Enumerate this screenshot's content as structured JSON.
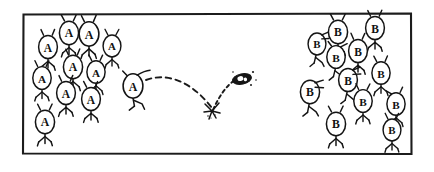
{
  "scene": {
    "title": "Two groups of stick figures separated by a thrown projectile",
    "background_color": "#ffffff",
    "ink_color": "#141414",
    "width": 434,
    "height": 172
  },
  "frame": {
    "name": "panel-border",
    "x": 22,
    "y": 13,
    "width": 390,
    "height": 142,
    "stroke_color": "#1c1c1c",
    "stroke_width": 2.1
  },
  "groups": [
    {
      "id": "group-a",
      "label": "A",
      "side": "left",
      "count": 11,
      "description": "Crowd of stick figures each with an oval head marked A",
      "figures": [
        {
          "id": "a1",
          "x": 48,
          "y": 47,
          "scale": 1.0,
          "flip": false,
          "arms": "up",
          "label": "A"
        },
        {
          "id": "a2",
          "x": 69,
          "y": 33,
          "scale": 1.02,
          "flip": false,
          "arms": "up",
          "label": "A"
        },
        {
          "id": "a3",
          "x": 89,
          "y": 34,
          "scale": 1.05,
          "flip": false,
          "arms": "up",
          "label": "A"
        },
        {
          "id": "a4",
          "x": 112,
          "y": 46,
          "scale": 0.95,
          "flip": false,
          "arms": "up",
          "label": "A"
        },
        {
          "id": "a5",
          "x": 73,
          "y": 67,
          "scale": 1.02,
          "flip": false,
          "arms": "up",
          "label": "A"
        },
        {
          "id": "a6",
          "x": 96,
          "y": 72,
          "scale": 0.97,
          "flip": false,
          "arms": "up",
          "label": "A"
        },
        {
          "id": "a7",
          "x": 42,
          "y": 78,
          "scale": 0.98,
          "flip": false,
          "arms": "up",
          "label": "A"
        },
        {
          "id": "a8",
          "x": 66,
          "y": 93,
          "scale": 1.0,
          "flip": false,
          "arms": "up",
          "label": "A"
        },
        {
          "id": "a9",
          "x": 91,
          "y": 99,
          "scale": 1.0,
          "flip": false,
          "arms": "up",
          "label": "A"
        },
        {
          "id": "a10",
          "x": 45,
          "y": 122,
          "scale": 1.02,
          "flip": false,
          "arms": "up",
          "label": "A"
        },
        {
          "id": "a11",
          "x": 133,
          "y": 86,
          "scale": 1.03,
          "flip": false,
          "arms": "throwing",
          "label": "A"
        }
      ],
      "thrower_id": "a11"
    },
    {
      "id": "group-b",
      "label": "B",
      "side": "right",
      "count": 12,
      "description": "Crowd of stick figures each with an oval head marked B",
      "figures": [
        {
          "id": "b1",
          "x": 338,
          "y": 32,
          "scale": 1.02,
          "flip": false,
          "arms": "up",
          "label": "B"
        },
        {
          "id": "b2",
          "x": 375,
          "y": 28,
          "scale": 1.0,
          "flip": false,
          "arms": "up",
          "label": "B"
        },
        {
          "id": "b3",
          "x": 317,
          "y": 44,
          "scale": 0.95,
          "flip": true,
          "arms": "up",
          "label": "B"
        },
        {
          "id": "b4",
          "x": 358,
          "y": 51,
          "scale": 1.0,
          "flip": false,
          "arms": "up",
          "label": "B"
        },
        {
          "id": "b5",
          "x": 336,
          "y": 57,
          "scale": 0.98,
          "flip": true,
          "arms": "up",
          "label": "B"
        },
        {
          "id": "b6",
          "x": 381,
          "y": 73,
          "scale": 0.97,
          "flip": false,
          "arms": "up",
          "label": "B"
        },
        {
          "id": "b7",
          "x": 348,
          "y": 80,
          "scale": 1.0,
          "flip": true,
          "arms": "up",
          "label": "B"
        },
        {
          "id": "b8",
          "x": 310,
          "y": 92,
          "scale": 1.02,
          "flip": true,
          "arms": "up",
          "label": "B"
        },
        {
          "id": "b9",
          "x": 363,
          "y": 101,
          "scale": 0.98,
          "flip": false,
          "arms": "up",
          "label": "B"
        },
        {
          "id": "b10",
          "x": 396,
          "y": 104,
          "scale": 0.97,
          "flip": false,
          "arms": "up",
          "label": "B"
        },
        {
          "id": "b11",
          "x": 336,
          "y": 124,
          "scale": 1.02,
          "flip": false,
          "arms": "up",
          "label": "B"
        },
        {
          "id": "b12",
          "x": 392,
          "y": 130,
          "scale": 0.95,
          "flip": false,
          "arms": "up",
          "label": "B"
        }
      ]
    }
  ],
  "projectile": {
    "name": "thrown-rock",
    "x": 242,
    "y": 79,
    "color": "#151515",
    "description": "Small dark object in flight after bouncing"
  },
  "trajectory": {
    "name": "flight-path",
    "style": "dashed",
    "stroke_color": "#1a1a1a",
    "incoming_path": "M 146 80 C 168 72, 192 82, 212 108",
    "outgoing_path": "M 213 110 C 219 95, 228 84, 236 80",
    "impact": {
      "name": "impact-burst",
      "x": 212,
      "y": 111,
      "description": "Burst mark where the projectile bounced off the ground"
    }
  }
}
